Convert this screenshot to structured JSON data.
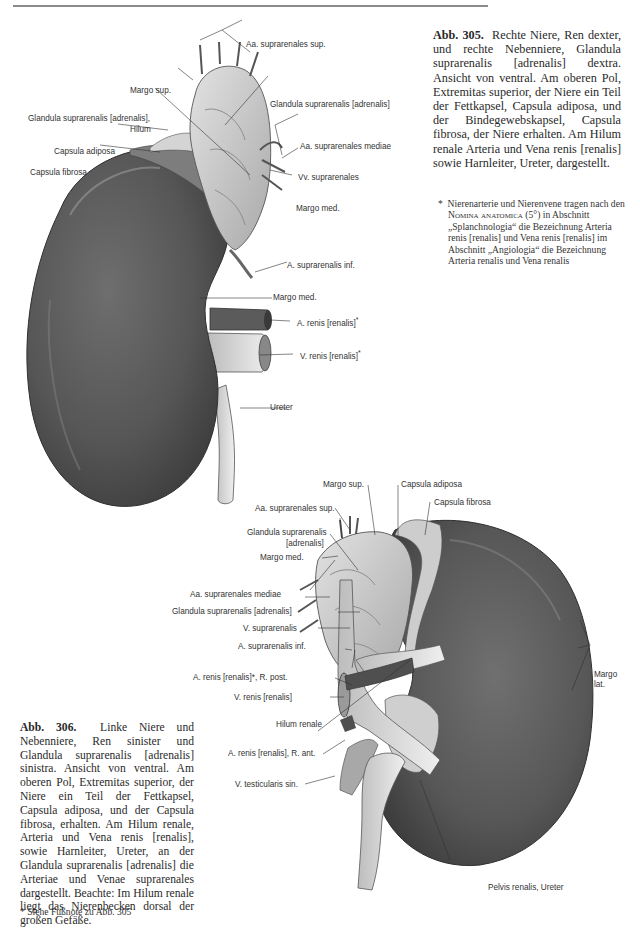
{
  "page": {
    "top_rule": true
  },
  "fig305": {
    "caption_label": "Abb. 305.",
    "caption_text": "Rechte Niere, Ren dexter, und rechte Nebenniere, Glandula suprarenalis [adrenalis] dextra. Ansicht von ventral. Am oberen Pol, Extremitas superior, der Niere ein Teil der Fettkapsel, Capsula adiposa, und der Bindegewebskapsel, Capsula fibrosa, der Niere erhalten. Am Hilum renale Arteria und Vena renis [renalis] sowie Harnleiter, Ureter, dargestellt.",
    "footnote_star": "*",
    "footnote_pre": "Nierenarterie und Nierenvene tragen nach den",
    "footnote_sc": "Nomina anatomica",
    "footnote_post": "(5°) in Abschnitt „Splanchnologia“ die Bezeichnung Arteria renis [renalis] und Vena renis [renalis] im Abschnitt „Angiologia“ die Bezeichnung Arteria renalis und Vena renalis",
    "labels": {
      "aa_suprarenales_sup": "Aa. suprarenales sup.",
      "margo_sup": "Margo sup.",
      "glandula": "Glandula suprarenalis [adrenalis]",
      "glandula_hilum_1": "Glandula suprarenalis  [adrenalis],",
      "glandula_hilum_2": "Hilum",
      "aa_suprarenales_mediae": "Aa. suprarenales mediae",
      "capsula_adiposa": "Capsula adiposa",
      "capsula_fibrosa": "Capsula fibrosa",
      "vv_suprarenales": "Vv. suprarenales",
      "margo_med_1": "Margo med.",
      "a_suprarenalis_inf": "A. suprarenalis inf.",
      "margo_med_2": "Margo med.",
      "a_renis": "A. renis [renalis]",
      "a_renis_star": "*",
      "v_renis": "V. renis [renalis]",
      "v_renis_star": "*",
      "ureter": "Ureter"
    }
  },
  "fig306": {
    "caption_label": "Abb. 306.",
    "caption_text": "Linke Niere und Nebenniere, Ren sinister und Glandula suprarenalis [adrenalis] sinistra. Ansicht von ventral. Am oberen Pol, Extremitas superior, der Niere ein Teil der Fettkapsel, Capsula adiposa, und der Capsula fibrosa, erhalten. Am Hilum renale, Arteria und Vena renis [renalis], sowie Harnleiter, Ureter, an der Glandula suprarenalis [adrenalis] die Arteriae und Venae suprarenales dargestellt. Beachte: Im Hilum renale liegt das Nierenbecken dorsal der großen Gefäße.",
    "footnote": "* Siehe Fußnote zu Abb. 305",
    "labels": {
      "margo_sup": "Margo sup.",
      "capsula_adiposa": "Capsula adiposa",
      "capsula_fibrosa": "Capsula fibrosa",
      "aa_suprarenales_sup": "Aa. suprarenales sup.",
      "glandula_1": "Glandula suprarenalis",
      "glandula_2": "[adrenalis]",
      "margo_med": "Margo med.",
      "aa_suprarenales_mediae": "Aa. suprarenales mediae",
      "glandula_full": "Glandula suprarenalis  [adrenalis]",
      "v_suprarenalis": "V. suprarenalis",
      "a_suprarenalis_inf": "A. suprarenalis inf.",
      "a_renis_post": "A.  renis [renalis]*,  R. post.",
      "v_renis": "V. renis  [renalis]",
      "hilum_renale": "Hilum renale",
      "a_renis_ant": "A. renis  [renalis], R. ant.",
      "v_testicularis": "V. testicularis sin.",
      "margo_lat_1": "Margo",
      "margo_lat_2": "lat.",
      "pelvis_ureter": "Pelvis renalis, Ureter"
    }
  },
  "colors": {
    "kidney_dark": "#4a4a4a",
    "kidney_mid": "#6b6b6b",
    "gland_light": "#c9c9c9",
    "vessel_light": "#dedede",
    "text": "#2a2a2a",
    "rule": "#8a8a8a"
  }
}
